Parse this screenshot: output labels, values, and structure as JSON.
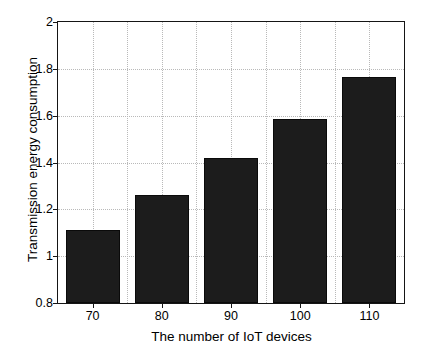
{
  "chart_data": {
    "type": "bar",
    "title": "",
    "xlabel": "The number of IoT devices",
    "ylabel": "Transmission energy consumption",
    "categories": [
      "70",
      "80",
      "90",
      "100",
      "110"
    ],
    "values": [
      1.11,
      1.26,
      1.42,
      1.585,
      1.765
    ],
    "ylim": [
      0.8,
      2
    ],
    "yticks": [
      "0.8",
      "1",
      "1.2",
      "1.4",
      "1.6",
      "1.8",
      "2"
    ],
    "ytick_values": [
      0.8,
      1,
      1.2,
      1.4,
      1.6,
      1.8,
      2
    ],
    "xticks": [
      "70",
      "80",
      "90",
      "100",
      "110"
    ],
    "grid": true,
    "legend": "none",
    "bar_color": "#1c1c1c",
    "bar_edge_color": "#0a0a0a",
    "grid_color": "#b9b9b9",
    "axis_color": "#151515",
    "background": "#ffffff"
  }
}
